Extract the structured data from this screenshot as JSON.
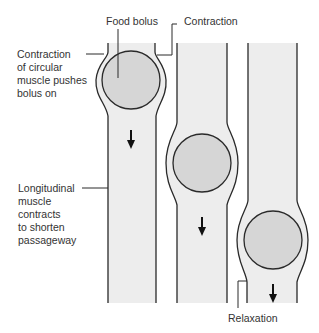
{
  "diagram": {
    "labels": {
      "food_bolus": "Food bolus",
      "contraction": "Contraction",
      "circular_muscle": "Contraction\nof circular\nmuscle pushes\nbolus on",
      "longitudinal_muscle": "Longitudinal\nmuscle\ncontracts\nto shorten\npassageway",
      "relaxation": "Relaxation"
    },
    "stages": [
      {
        "name": "stage-1",
        "bolus_position": "top"
      },
      {
        "name": "stage-2",
        "bolus_position": "middle"
      },
      {
        "name": "stage-3",
        "bolus_position": "bottom"
      }
    ],
    "colors": {
      "tube_fill": "#ededed",
      "bolus_fill": "#d6d6d6",
      "outline": "#2a2a2a"
    }
  }
}
